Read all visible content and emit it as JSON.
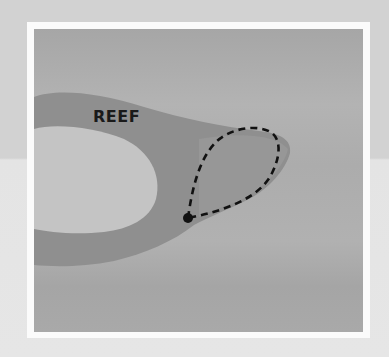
{
  "figure": {
    "labels": {
      "reef": "REEF"
    },
    "colors": {
      "page_top": "#d2d2d2",
      "page_bottom": "#e6e6e6",
      "frame": "#fbfbfb",
      "water": "#a9a9a9",
      "reef_band": "#8f8f8f",
      "lagoon": "#c4c4c4",
      "path": "#111111"
    },
    "elements": [
      {
        "type": "region",
        "name": "reef",
        "shape": "curved band / ring with tail extending right"
      },
      {
        "type": "region",
        "name": "lagoon",
        "shape": "light inner area enclosed by reef"
      },
      {
        "type": "path",
        "name": "current-loop",
        "style": "dashed",
        "shape": "teardrop loop"
      },
      {
        "type": "point",
        "name": "loop-origin",
        "style": "filled dot"
      }
    ]
  }
}
